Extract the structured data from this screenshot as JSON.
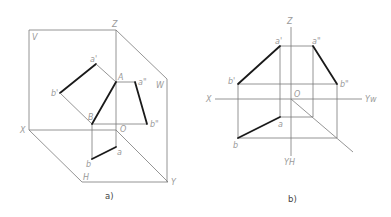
{
  "figure_a": {
    "caption": "a)",
    "labels": {
      "V": "V",
      "Z": "Z",
      "W": "W",
      "X": "X",
      "H": "H",
      "Y": "Y",
      "O": "O",
      "A": "A",
      "B": "B",
      "a_prime": "a'",
      "b_prime": "b'",
      "a_dprime": "a\"",
      "b_dprime": "b\"",
      "a": "a",
      "b": "b"
    }
  },
  "figure_b": {
    "caption": "b)",
    "labels": {
      "Z": "Z",
      "X": "X",
      "O": "O",
      "YW": "Yw",
      "YH": "YH",
      "a_prime": "a'",
      "a_dprime": "a\"",
      "b_prime": "b'",
      "b_dprime": "b\"",
      "a": "a",
      "b": "b"
    }
  }
}
